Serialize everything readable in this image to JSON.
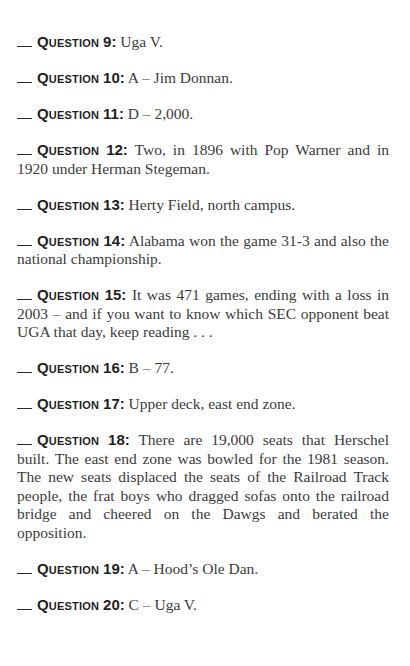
{
  "answers": [
    {
      "label": "Question",
      "number": "9:",
      "text": "Uga V."
    },
    {
      "label": "Question",
      "number": "10:",
      "text": "A – Jim Donnan."
    },
    {
      "label": "Question",
      "number": "11:",
      "text": "D – 2,000."
    },
    {
      "label": "Question",
      "number": "12:",
      "text": "Two, in 1896 with Pop Warner and in 1920 under Herman Stegeman."
    },
    {
      "label": "Question",
      "number": "13:",
      "text": "Herty Field, north campus."
    },
    {
      "label": "Question",
      "number": "14:",
      "text": "Alabama won the game 31-3 and also the national championship."
    },
    {
      "label": "Question",
      "number": "15:",
      "text": "It was 471 games, ending with a loss in 2003 – and if you want to know which SEC opponent beat UGA that day, keep reading . . ."
    },
    {
      "label": "Question",
      "number": "16:",
      "text": "B – 77."
    },
    {
      "label": "Question",
      "number": "17:",
      "text": "Upper deck, east end zone."
    },
    {
      "label": "Question",
      "number": "18:",
      "text": "There are 19,000 seats that Herschel built. The east end zone was bowled for the 1981 season.  The new seats displaced the seats of the Railroad Track people, the frat boys who dragged sofas onto the railroad bridge and cheered on the Dawgs and berated the opposition."
    },
    {
      "label": "Question",
      "number": "19:",
      "text": "A – Hood’s Ole Dan."
    },
    {
      "label": "Question",
      "number": "20:",
      "text": "C – Uga V."
    }
  ]
}
